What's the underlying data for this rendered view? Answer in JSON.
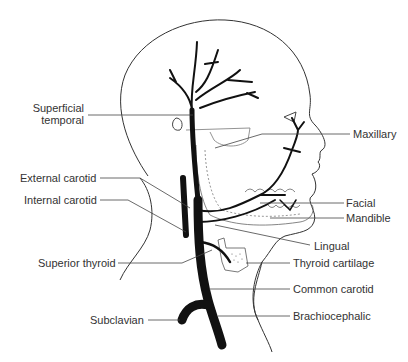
{
  "diagram": {
    "title": "",
    "labels": {
      "superficial_temporal_1": "Superficial",
      "superficial_temporal_2": "temporal",
      "maxillary": "Maxillary",
      "external_carotid": "External carotid",
      "internal_carotid": "Internal carotid",
      "facial": "Facial",
      "mandible": "Mandible",
      "lingual": "Lingual",
      "superior_thyroid": "Superior thyroid",
      "thyroid_cartilage": "Thyroid cartilage",
      "common_carotid": "Common carotid",
      "subclavian": "Subclavian",
      "brachiocephalic": "Brachiocephalic"
    },
    "colors": {
      "artery": "#111111",
      "outline": "#333333",
      "leader": "#444444",
      "bone_dash": "#999999"
    }
  }
}
